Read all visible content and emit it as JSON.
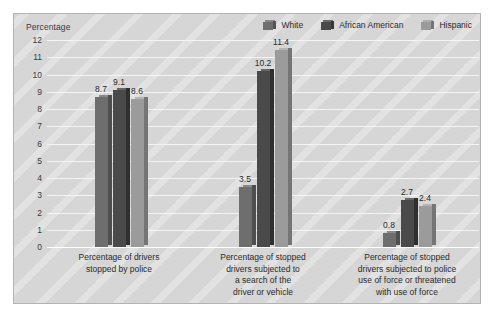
{
  "chart_data": {
    "type": "bar",
    "title": "",
    "subtitle": "",
    "ylabel": "Percentage",
    "xlabel": "",
    "ylim": [
      0,
      12
    ],
    "yticks": [
      12,
      11,
      10,
      9,
      8,
      7,
      6,
      5,
      4,
      3,
      2,
      1,
      0
    ],
    "grid": true,
    "legend_position": "top-right",
    "categories": [
      "Percentage of drivers stopped by police",
      "Percentage of stopped drivers subjected to a search of the driver or vehicle",
      "Percentage of stopped drivers subjected to police use of force or threatened with use of force"
    ],
    "category_lines": [
      [
        "Percentage of drivers",
        "stopped by police"
      ],
      [
        "Percentage of stopped",
        "drivers subjected to",
        "a search of the",
        "driver or vehicle"
      ],
      [
        "Percentage of stopped",
        "drivers subjected to police",
        "use of force or threatened",
        "with use of force"
      ]
    ],
    "series": [
      {
        "name": "White",
        "color": "#6e6e6e",
        "values": [
          8.7,
          3.5,
          0.8
        ]
      },
      {
        "name": "African American",
        "color": "#4a4a4a",
        "values": [
          9.1,
          10.2,
          2.7
        ]
      },
      {
        "name": "Hispanic",
        "color": "#9b9b9b",
        "values": [
          8.6,
          11.4,
          2.4
        ]
      }
    ]
  },
  "legend": {
    "items": [
      {
        "label": "White"
      },
      {
        "label": "African American"
      },
      {
        "label": "Hispanic"
      }
    ]
  }
}
